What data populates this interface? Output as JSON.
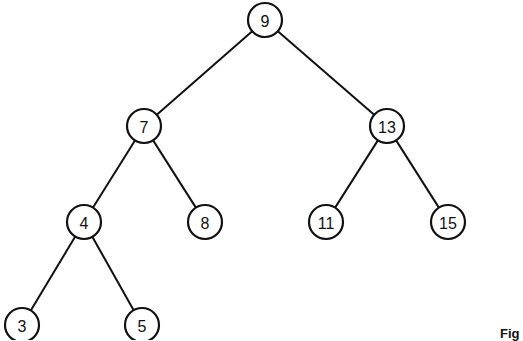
{
  "diagram": {
    "type": "binary-search-tree",
    "nodes": [
      {
        "id": "n9",
        "label": "9",
        "x": 265,
        "y": 20
      },
      {
        "id": "n7",
        "label": "7",
        "x": 144,
        "y": 126
      },
      {
        "id": "n13",
        "label": "13",
        "x": 387,
        "y": 126
      },
      {
        "id": "n4",
        "label": "4",
        "x": 84,
        "y": 222
      },
      {
        "id": "n8",
        "label": "8",
        "x": 205,
        "y": 222
      },
      {
        "id": "n11",
        "label": "11",
        "x": 326,
        "y": 222
      },
      {
        "id": "n15",
        "label": "15",
        "x": 448,
        "y": 222
      },
      {
        "id": "n3",
        "label": "3",
        "x": 22,
        "y": 325
      },
      {
        "id": "n5",
        "label": "5",
        "x": 142,
        "y": 325
      }
    ],
    "edges": [
      {
        "from": "n9",
        "to": "n7"
      },
      {
        "from": "n9",
        "to": "n13"
      },
      {
        "from": "n7",
        "to": "n4"
      },
      {
        "from": "n7",
        "to": "n8"
      },
      {
        "from": "n13",
        "to": "n11"
      },
      {
        "from": "n13",
        "to": "n15"
      },
      {
        "from": "n4",
        "to": "n3"
      },
      {
        "from": "n4",
        "to": "n5"
      }
    ],
    "node_radius": 17
  },
  "figure_label": "Fig"
}
